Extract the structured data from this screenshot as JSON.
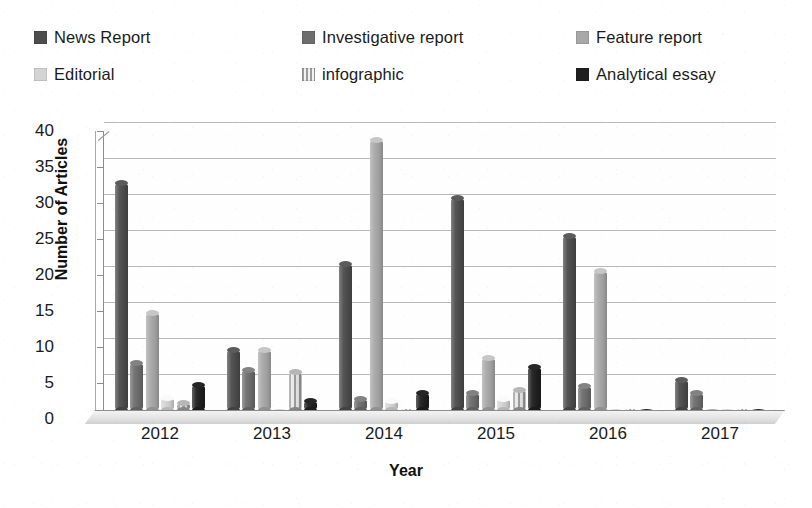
{
  "chart_data": {
    "type": "bar",
    "title": "",
    "subtitle": "",
    "xlabel": "Year",
    "ylabel": "Number of Articles",
    "categories": [
      "2012",
      "2013",
      "2014",
      "2015",
      "2016",
      "2017"
    ],
    "ylim": [
      0,
      40
    ],
    "ytick_step": 5,
    "yticks": [
      "40",
      "35",
      "30",
      "25",
      "20",
      "15",
      "10",
      "5",
      "0"
    ],
    "grid": true,
    "legend_position": "top",
    "style_3d": true,
    "series": [
      {
        "name": "News Report",
        "color": "#4d4d4d",
        "values": [
          31.5,
          8.3,
          20.3,
          29.5,
          24.2,
          4.2
        ]
      },
      {
        "name": "Investigative report",
        "color": "#6e6e6e",
        "values": [
          6.5,
          5.5,
          1.5,
          2.3,
          3.3,
          2.3
        ]
      },
      {
        "name": "Feature report",
        "color": "#a8a8a8",
        "values": [
          13.5,
          8.3,
          37.5,
          7.2,
          19.3,
          0.2
        ]
      },
      {
        "name": "Editorial",
        "color": "#d4d4d4",
        "values": [
          1.6,
          0.3,
          1.3,
          1.5,
          0.3,
          0.2
        ]
      },
      {
        "name": "infographic",
        "color": "#9b9b9b",
        "pattern": "striped",
        "values": [
          1.0,
          5.3,
          0.3,
          2.8,
          0.2,
          0.1
        ]
      },
      {
        "name": "Analytical essay",
        "color": "#1f1f1f",
        "values": [
          3.5,
          1.3,
          2.3,
          6.0,
          0.3,
          0.3
        ]
      }
    ]
  },
  "legend": {
    "items": [
      {
        "label": "News Report",
        "color": "#4d4d4d"
      },
      {
        "label": "Investigative report",
        "color": "#6e6e6e"
      },
      {
        "label": "Feature report",
        "color": "#a8a8a8"
      },
      {
        "label": "Editorial",
        "color": "#d4d4d4"
      },
      {
        "label": "infographic",
        "color": "#9b9b9b"
      },
      {
        "label": "Analytical essay",
        "color": "#1f1f1f"
      }
    ]
  },
  "axes": {
    "y_title": "Number of Articles",
    "x_title": "Year"
  }
}
